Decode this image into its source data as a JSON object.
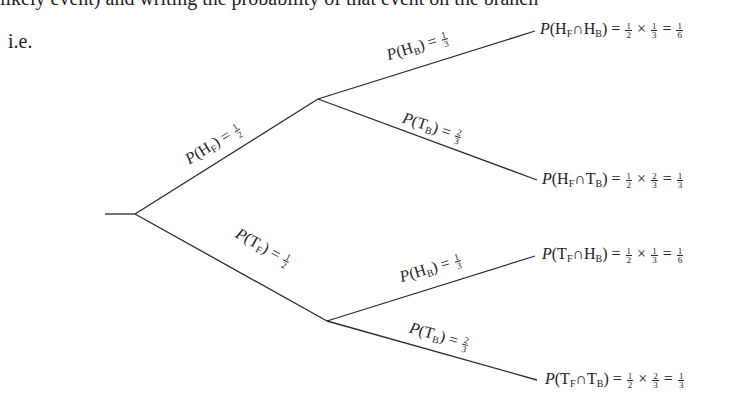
{
  "text": {
    "intro_line": "likely event) and writing the probability of that event on the branch",
    "ie": "i.e."
  },
  "tree": {
    "branches": {
      "hf": {
        "p": "P",
        "open": "(",
        "event": "H",
        "sub": "F",
        "close": ") = ",
        "num": "1",
        "den": "2"
      },
      "tf": {
        "p": "P",
        "open": "(",
        "event": "T",
        "sub": "F",
        "close": ") = ",
        "num": "1",
        "den": "2"
      },
      "hf_hb": {
        "p": "P",
        "open": "(",
        "event": "H",
        "sub": "B",
        "close": ") = ",
        "num": "1",
        "den": "3"
      },
      "hf_tb": {
        "p": "P",
        "open": "(",
        "event": "T",
        "sub": "B",
        "close": ") = ",
        "num": "2",
        "den": "3"
      },
      "tf_hb": {
        "p": "P",
        "open": "(",
        "event": "H",
        "sub": "B",
        "close": ") = ",
        "num": "1",
        "den": "3"
      },
      "tf_tb": {
        "p": "P",
        "open": "(",
        "event": "T",
        "sub": "B",
        "close": ") = ",
        "num": "2",
        "den": "3"
      }
    },
    "outcomes": [
      {
        "p": "P",
        "e1": "H",
        "s1": "F",
        "cap": "∩",
        "e2": "H",
        "s2": "B",
        "n1": "1",
        "d1": "2",
        "n2": "1",
        "d2": "3",
        "rn": "1",
        "rd": "6"
      },
      {
        "p": "P",
        "e1": "H",
        "s1": "F",
        "cap": "∩",
        "e2": "T",
        "s2": "B",
        "n1": "1",
        "d1": "2",
        "n2": "2",
        "d2": "3",
        "rn": "1",
        "rd": "3"
      },
      {
        "p": "P",
        "e1": "T",
        "s1": "F",
        "cap": "∩",
        "e2": "H",
        "s2": "B",
        "n1": "1",
        "d1": "2",
        "n2": "1",
        "d2": "3",
        "rn": "1",
        "rd": "6"
      },
      {
        "p": "P",
        "e1": "T",
        "s1": "F",
        "cap": "∩",
        "e2": "T",
        "s2": "B",
        "n1": "1",
        "d1": "2",
        "n2": "2",
        "d2": "3",
        "rn": "1",
        "rd": "3"
      }
    ],
    "symbols": {
      "open": "(",
      "close": ")",
      "eq": " = ",
      "times": " × "
    }
  }
}
